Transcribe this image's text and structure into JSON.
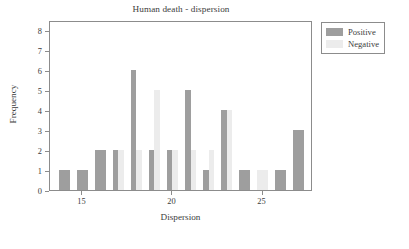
{
  "chart_data": {
    "type": "bar",
    "title": "Human death - dispersion",
    "xlabel": "Dispersion",
    "ylabel": "Frequency",
    "xlim": [
      13.2,
      27.8
    ],
    "ylim": [
      0,
      8.5
    ],
    "grid": false,
    "legend_position": "outside-top-right",
    "x_ticks": [
      15,
      20,
      25
    ],
    "x_tick_labels": [
      "15",
      "20",
      "25"
    ],
    "y_ticks": [
      0,
      1,
      2,
      3,
      4,
      5,
      6,
      7,
      8
    ],
    "y_tick_labels": [
      "0",
      "1",
      "2",
      "3",
      "4",
      "5",
      "6",
      "7",
      "8"
    ],
    "categories": [
      14,
      15,
      16,
      17,
      18,
      19,
      20,
      21,
      22,
      23,
      24,
      25,
      26,
      27
    ],
    "series": [
      {
        "name": "Positive",
        "color": "#9e9e9e",
        "values": [
          1,
          1,
          2,
          2,
          6,
          2,
          2,
          5,
          1,
          4,
          1,
          0,
          1,
          3
        ]
      },
      {
        "name": "Negative",
        "color": "#ececec",
        "values": [
          0,
          0,
          0,
          2,
          2,
          5,
          2,
          2,
          2,
          4,
          0,
          1,
          0,
          0
        ]
      }
    ]
  },
  "legend": {
    "items": [
      {
        "label": "Positive",
        "swatch": "positive"
      },
      {
        "label": "Negative",
        "swatch": "negative"
      }
    ]
  },
  "colors": {
    "positive": "#9e9e9e",
    "negative": "#ececec",
    "axis": "#8c8c8c",
    "text": "#3c3c3c",
    "background": "#ffffff"
  }
}
